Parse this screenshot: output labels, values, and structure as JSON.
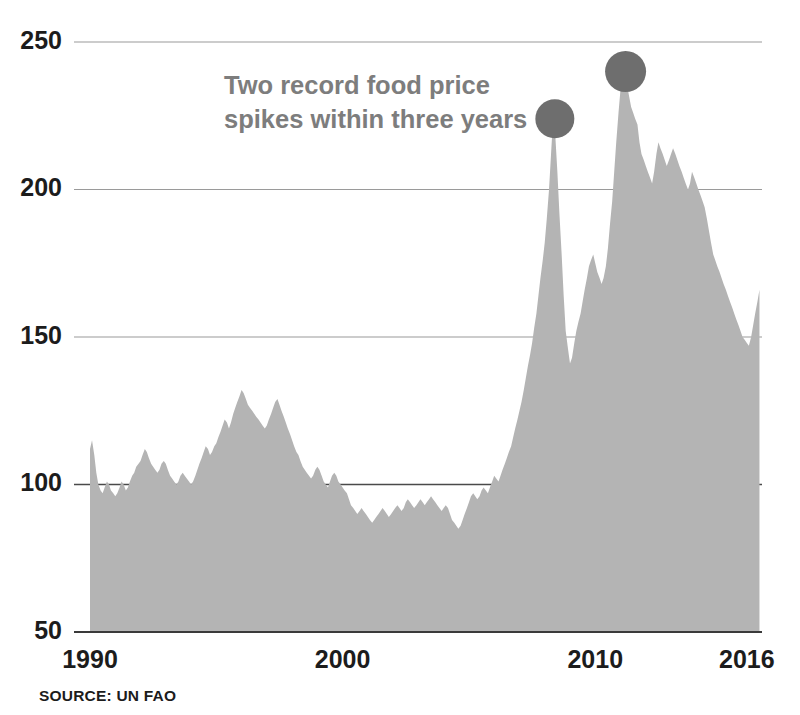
{
  "chart_data": {
    "type": "area",
    "title": "",
    "annotation": "Two record food price spikes within three years",
    "annotation_line1": "Two record food price",
    "annotation_line2": "spikes within three years",
    "source": "SOURCE: UN FAO",
    "xlabel": "",
    "ylabel": "",
    "xlim": [
      1990,
      2016.6
    ],
    "ylim": [
      50,
      250
    ],
    "grid": true,
    "legend": "none",
    "baseline": 50,
    "yticks": [
      50,
      100,
      150,
      200,
      250
    ],
    "ytick_labels": [
      "50",
      "100",
      "150",
      "200",
      "250"
    ],
    "xticks": [
      1990,
      2000,
      2010,
      2016
    ],
    "xtick_labels": [
      "1990",
      "2000",
      "2010",
      "2016"
    ],
    "emphasized_gridline": 100,
    "colors": {
      "area_fill": "#b4b4b4",
      "marker": "#6e6e6e",
      "annotation_text": "#7d7d7d",
      "tick_text": "#1c1c1c",
      "gridline": "#9a9a9a",
      "gridline_strong": "#4a4a4a",
      "background": "#ffffff"
    },
    "markers": [
      {
        "label": "2008 record spike",
        "x": 2008.4,
        "y": 224
      },
      {
        "label": "2011 record spike",
        "x": 2011.2,
        "y": 240
      }
    ],
    "series": [
      {
        "name": "FAO Food Price Index",
        "x": [
          1990.0,
          1990.08,
          1990.17,
          1990.25,
          1990.33,
          1990.42,
          1990.5,
          1990.58,
          1990.67,
          1990.75,
          1990.83,
          1990.92,
          1991.0,
          1991.08,
          1991.17,
          1991.25,
          1991.33,
          1991.42,
          1991.5,
          1991.58,
          1991.67,
          1991.75,
          1991.83,
          1991.92,
          1992.0,
          1992.08,
          1992.17,
          1992.25,
          1992.33,
          1992.42,
          1992.5,
          1992.58,
          1992.67,
          1992.75,
          1992.83,
          1992.92,
          1993.0,
          1993.08,
          1993.17,
          1993.25,
          1993.33,
          1993.42,
          1993.5,
          1993.58,
          1993.67,
          1993.75,
          1993.83,
          1993.92,
          1994.0,
          1994.08,
          1994.17,
          1994.25,
          1994.33,
          1994.42,
          1994.5,
          1994.58,
          1994.67,
          1994.75,
          1994.83,
          1994.92,
          1995.0,
          1995.08,
          1995.17,
          1995.25,
          1995.33,
          1995.42,
          1995.5,
          1995.58,
          1995.67,
          1995.75,
          1995.83,
          1995.92,
          1996.0,
          1996.08,
          1996.17,
          1996.25,
          1996.33,
          1996.42,
          1996.5,
          1996.58,
          1996.67,
          1996.75,
          1996.83,
          1996.92,
          1997.0,
          1997.08,
          1997.17,
          1997.25,
          1997.33,
          1997.42,
          1997.5,
          1997.58,
          1997.67,
          1997.75,
          1997.83,
          1997.92,
          1998.0,
          1998.08,
          1998.17,
          1998.25,
          1998.33,
          1998.42,
          1998.5,
          1998.58,
          1998.67,
          1998.75,
          1998.83,
          1998.92,
          1999.0,
          1999.08,
          1999.17,
          1999.25,
          1999.33,
          1999.42,
          1999.5,
          1999.58,
          1999.67,
          1999.75,
          1999.83,
          1999.92,
          2000.0,
          2000.08,
          2000.17,
          2000.25,
          2000.33,
          2000.42,
          2000.5,
          2000.58,
          2000.67,
          2000.75,
          2000.83,
          2000.92,
          2001.0,
          2001.08,
          2001.17,
          2001.25,
          2001.33,
          2001.42,
          2001.5,
          2001.58,
          2001.67,
          2001.75,
          2001.83,
          2001.92,
          2002.0,
          2002.08,
          2002.17,
          2002.25,
          2002.33,
          2002.42,
          2002.5,
          2002.58,
          2002.67,
          2002.75,
          2002.83,
          2002.92,
          2003.0,
          2003.08,
          2003.17,
          2003.25,
          2003.33,
          2003.42,
          2003.5,
          2003.58,
          2003.67,
          2003.75,
          2003.83,
          2003.92,
          2004.0,
          2004.08,
          2004.17,
          2004.25,
          2004.33,
          2004.42,
          2004.5,
          2004.58,
          2004.67,
          2004.75,
          2004.83,
          2004.92,
          2005.0,
          2005.08,
          2005.17,
          2005.25,
          2005.33,
          2005.42,
          2005.5,
          2005.58,
          2005.67,
          2005.75,
          2005.83,
          2005.92,
          2006.0,
          2006.08,
          2006.17,
          2006.25,
          2006.33,
          2006.42,
          2006.5,
          2006.58,
          2006.67,
          2006.75,
          2006.83,
          2006.92,
          2007.0,
          2007.08,
          2007.17,
          2007.25,
          2007.33,
          2007.42,
          2007.5,
          2007.58,
          2007.67,
          2007.75,
          2007.83,
          2007.92,
          2008.0,
          2008.08,
          2008.17,
          2008.25,
          2008.33,
          2008.42,
          2008.5,
          2008.58,
          2008.67,
          2008.75,
          2008.83,
          2008.92,
          2009.0,
          2009.08,
          2009.17,
          2009.25,
          2009.33,
          2009.42,
          2009.5,
          2009.58,
          2009.67,
          2009.75,
          2009.83,
          2009.92,
          2010.0,
          2010.08,
          2010.17,
          2010.25,
          2010.33,
          2010.42,
          2010.5,
          2010.58,
          2010.67,
          2010.75,
          2010.83,
          2010.92,
          2011.0,
          2011.08,
          2011.17,
          2011.25,
          2011.33,
          2011.42,
          2011.5,
          2011.58,
          2011.67,
          2011.75,
          2011.83,
          2011.92,
          2012.0,
          2012.08,
          2012.17,
          2012.25,
          2012.33,
          2012.42,
          2012.5,
          2012.58,
          2012.67,
          2012.75,
          2012.83,
          2012.92,
          2013.0,
          2013.08,
          2013.17,
          2013.25,
          2013.33,
          2013.42,
          2013.5,
          2013.58,
          2013.67,
          2013.75,
          2013.83,
          2013.92,
          2014.0,
          2014.08,
          2014.17,
          2014.25,
          2014.33,
          2014.42,
          2014.5,
          2014.58,
          2014.67,
          2014.75,
          2014.83,
          2014.92,
          2015.0,
          2015.08,
          2015.17,
          2015.25,
          2015.33,
          2015.42,
          2015.5,
          2015.58,
          2015.67,
          2015.75,
          2015.83,
          2015.92,
          2016.0,
          2016.08,
          2016.17,
          2016.25,
          2016.33,
          2016.42,
          2016.5
        ],
        "values": [
          112,
          115,
          110,
          104,
          100,
          98,
          97,
          99,
          101,
          100,
          98,
          97,
          96,
          97,
          99,
          101,
          100,
          98,
          99,
          101,
          103,
          104,
          106,
          107,
          108,
          110,
          112,
          111,
          109,
          107,
          106,
          105,
          104,
          105,
          107,
          108,
          107,
          105,
          103,
          102,
          101,
          100,
          101,
          103,
          104,
          103,
          102,
          101,
          100,
          101,
          103,
          105,
          107,
          109,
          111,
          113,
          112,
          110,
          111,
          113,
          114,
          116,
          118,
          120,
          122,
          121,
          119,
          121,
          124,
          126,
          128,
          130,
          132,
          131,
          129,
          127,
          126,
          125,
          124,
          123,
          122,
          121,
          120,
          119,
          120,
          122,
          124,
          126,
          128,
          129,
          127,
          125,
          123,
          121,
          119,
          117,
          115,
          113,
          111,
          110,
          108,
          106,
          105,
          104,
          103,
          102,
          103,
          105,
          106,
          105,
          103,
          101,
          100,
          99,
          101,
          103,
          104,
          103,
          101,
          100,
          99,
          98,
          97,
          95,
          93,
          92,
          91,
          90,
          91,
          92,
          91,
          90,
          89,
          88,
          87,
          88,
          89,
          90,
          91,
          92,
          91,
          90,
          89,
          90,
          91,
          92,
          93,
          92,
          91,
          92,
          94,
          95,
          94,
          93,
          92,
          93,
          94,
          95,
          94,
          93,
          94,
          95,
          96,
          95,
          94,
          93,
          92,
          91,
          92,
          93,
          92,
          90,
          88,
          87,
          86,
          85,
          86,
          88,
          90,
          92,
          94,
          96,
          97,
          96,
          95,
          96,
          98,
          99,
          98,
          97,
          99,
          101,
          103,
          102,
          101,
          103,
          105,
          107,
          109,
          111,
          113,
          116,
          119,
          122,
          125,
          128,
          132,
          136,
          140,
          144,
          148,
          153,
          158,
          164,
          170,
          176,
          182,
          190,
          200,
          212,
          224,
          218,
          206,
          192,
          178,
          164,
          152,
          146,
          141,
          143,
          148,
          152,
          155,
          158,
          162,
          166,
          170,
          174,
          176,
          178,
          175,
          172,
          170,
          168,
          170,
          174,
          180,
          188,
          196,
          206,
          216,
          226,
          234,
          238,
          240,
          236,
          232,
          228,
          226,
          224,
          222,
          216,
          212,
          210,
          208,
          206,
          204,
          202,
          206,
          212,
          216,
          214,
          212,
          210,
          208,
          210,
          212,
          214,
          212,
          210,
          208,
          206,
          204,
          202,
          200,
          202,
          206,
          204,
          202,
          200,
          198,
          196,
          194,
          190,
          186,
          182,
          178,
          176,
          174,
          172,
          170,
          168,
          166,
          164,
          162,
          160,
          158,
          156,
          154,
          152,
          150,
          149,
          148,
          147,
          150,
          154,
          158,
          162,
          166
        ]
      }
    ]
  },
  "axis": {
    "y_title": "",
    "x_title": ""
  }
}
